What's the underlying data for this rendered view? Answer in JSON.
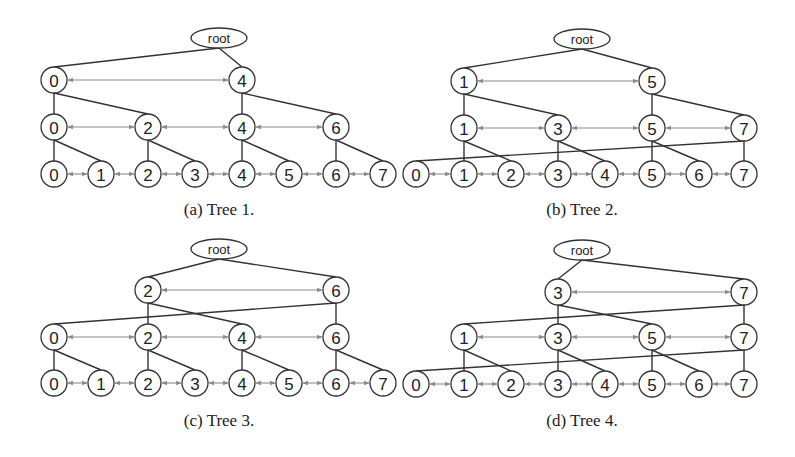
{
  "figure": {
    "arrow_color": "#8a8a8a",
    "edge_color": "#333333",
    "node_radius": 13,
    "panels": [
      {
        "id": "a",
        "caption": "(a)  Tree 1.",
        "caption_pos": [
          219,
          212
        ],
        "root": {
          "label": "root",
          "x": 219,
          "y": 38,
          "rx": 28,
          "ry": 10
        },
        "levels": [
          {
            "y": 80,
            "nodes": [
              {
                "label": "0",
                "x": 54
              },
              {
                "label": "4",
                "x": 242
              }
            ]
          },
          {
            "y": 127,
            "nodes": [
              {
                "label": "0",
                "x": 54
              },
              {
                "label": "2",
                "x": 148
              },
              {
                "label": "4",
                "x": 242
              },
              {
                "label": "6",
                "x": 336
              }
            ]
          },
          {
            "y": 174,
            "nodes": [
              {
                "label": "0",
                "x": 54
              },
              {
                "label": "1",
                "x": 101
              },
              {
                "label": "2",
                "x": 148
              },
              {
                "label": "3",
                "x": 195
              },
              {
                "label": "4",
                "x": 242
              },
              {
                "label": "5",
                "x": 289
              },
              {
                "label": "6",
                "x": 336
              },
              {
                "label": "7",
                "x": 383
              }
            ]
          }
        ],
        "root_children": [
          0,
          1
        ],
        "children": [
          [
            [
              0,
              1
            ],
            [
              2,
              3
            ]
          ],
          [
            [
              0,
              1
            ],
            [
              2,
              3
            ],
            [
              4,
              5
            ],
            [
              6,
              7
            ]
          ]
        ]
      },
      {
        "id": "b",
        "caption": "(b)  Tree 2.",
        "caption_pos": [
          582,
          212
        ],
        "root": {
          "label": "root",
          "x": 582,
          "y": 39,
          "rx": 28,
          "ry": 10
        },
        "levels": [
          {
            "y": 81,
            "nodes": [
              {
                "label": "1",
                "x": 464
              },
              {
                "label": "5",
                "x": 652
              }
            ]
          },
          {
            "y": 128,
            "nodes": [
              {
                "label": "1",
                "x": 464
              },
              {
                "label": "3",
                "x": 558
              },
              {
                "label": "5",
                "x": 652
              },
              {
                "label": "7",
                "x": 744
              }
            ]
          },
          {
            "y": 174,
            "nodes": [
              {
                "label": "0",
                "x": 416
              },
              {
                "label": "1",
                "x": 464
              },
              {
                "label": "2",
                "x": 511
              },
              {
                "label": "3",
                "x": 558
              },
              {
                "label": "4",
                "x": 605
              },
              {
                "label": "5",
                "x": 652
              },
              {
                "label": "6",
                "x": 699
              },
              {
                "label": "7",
                "x": 744
              }
            ]
          }
        ],
        "root_children": [
          0,
          1
        ],
        "children": [
          [
            [
              0,
              1
            ],
            [
              2,
              3
            ]
          ],
          [
            [
              1,
              2
            ],
            [
              3,
              4
            ],
            [
              5,
              6
            ],
            [
              7,
              0
            ]
          ]
        ]
      },
      {
        "id": "c",
        "caption": "(c)  Tree 3.",
        "caption_pos": [
          219,
          423
        ],
        "root": {
          "label": "root",
          "x": 219,
          "y": 249,
          "rx": 28,
          "ry": 10
        },
        "levels": [
          {
            "y": 290,
            "nodes": [
              {
                "label": "2",
                "x": 148
              },
              {
                "label": "6",
                "x": 336
              }
            ]
          },
          {
            "y": 337,
            "nodes": [
              {
                "label": "0",
                "x": 54
              },
              {
                "label": "2",
                "x": 148
              },
              {
                "label": "4",
                "x": 242
              },
              {
                "label": "6",
                "x": 336
              }
            ]
          },
          {
            "y": 383,
            "nodes": [
              {
                "label": "0",
                "x": 54
              },
              {
                "label": "1",
                "x": 101
              },
              {
                "label": "2",
                "x": 148
              },
              {
                "label": "3",
                "x": 195
              },
              {
                "label": "4",
                "x": 242
              },
              {
                "label": "5",
                "x": 289
              },
              {
                "label": "6",
                "x": 336
              },
              {
                "label": "7",
                "x": 383
              }
            ]
          }
        ],
        "root_children": [
          0,
          1
        ],
        "children": [
          [
            [
              1,
              2
            ],
            [
              3,
              0
            ]
          ],
          [
            [
              0,
              1
            ],
            [
              2,
              3
            ],
            [
              4,
              5
            ],
            [
              6,
              7
            ]
          ]
        ]
      },
      {
        "id": "d",
        "caption": "(d)  Tree 4.",
        "caption_pos": [
          582,
          423
        ],
        "root": {
          "label": "root",
          "x": 582,
          "y": 250,
          "rx": 28,
          "ry": 10
        },
        "levels": [
          {
            "y": 292,
            "nodes": [
              {
                "label": "3",
                "x": 558
              },
              {
                "label": "7",
                "x": 744
              }
            ]
          },
          {
            "y": 337,
            "nodes": [
              {
                "label": "1",
                "x": 464
              },
              {
                "label": "3",
                "x": 558
              },
              {
                "label": "5",
                "x": 652
              },
              {
                "label": "7",
                "x": 744
              }
            ]
          },
          {
            "y": 384,
            "nodes": [
              {
                "label": "0",
                "x": 416
              },
              {
                "label": "1",
                "x": 464
              },
              {
                "label": "2",
                "x": 511
              },
              {
                "label": "3",
                "x": 558
              },
              {
                "label": "4",
                "x": 605
              },
              {
                "label": "5",
                "x": 652
              },
              {
                "label": "6",
                "x": 699
              },
              {
                "label": "7",
                "x": 744
              }
            ]
          }
        ],
        "root_children": [
          0,
          1
        ],
        "children": [
          [
            [
              1,
              2
            ],
            [
              3,
              0
            ]
          ],
          [
            [
              1,
              2
            ],
            [
              3,
              4
            ],
            [
              5,
              6
            ],
            [
              7,
              0
            ]
          ]
        ]
      }
    ]
  }
}
